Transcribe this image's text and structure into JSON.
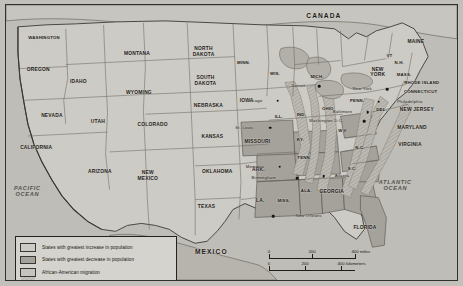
{
  "figure": {
    "kind": "thematic-map"
  },
  "countries": [
    {
      "name": "CANADA",
      "x": 330,
      "y": 16
    },
    {
      "name": "MEXICO",
      "x": 215,
      "y": 259
    }
  ],
  "oceans": [
    {
      "name": "PACIFIC",
      "name2": "OCEAN",
      "x": 27,
      "y": 196
    },
    {
      "name": "ATLANTIC",
      "name2": "OCEAN",
      "x": 403,
      "y": 190
    }
  ],
  "states": [
    {
      "label": "WASHINGTON",
      "x": 44,
      "y": 38,
      "size": "xs"
    },
    {
      "label": "OREGON",
      "x": 38,
      "y": 70,
      "size": "sm"
    },
    {
      "label": "IDAHO",
      "x": 79,
      "y": 83,
      "size": "sm"
    },
    {
      "label": "NEVADA",
      "x": 52,
      "y": 118,
      "size": "sm"
    },
    {
      "label": "CALIFORNIA",
      "x": 36,
      "y": 151,
      "size": "sm"
    },
    {
      "label": "MONTANA",
      "x": 139,
      "y": 54,
      "size": "sm"
    },
    {
      "label": "WYOMING",
      "x": 141,
      "y": 94,
      "size": "sm"
    },
    {
      "label": "UTAH",
      "x": 99,
      "y": 124,
      "size": "sm"
    },
    {
      "label": "COLORADO",
      "x": 155,
      "y": 127,
      "size": "sm"
    },
    {
      "label": "ARIZONA",
      "x": 101,
      "y": 176,
      "size": "sm"
    },
    {
      "label": "NORTH",
      "label2": "DAKOTA",
      "x": 207,
      "y": 52,
      "size": "sm"
    },
    {
      "label": "SOUTH",
      "label2": "DAKOTA",
      "x": 209,
      "y": 82,
      "size": "sm"
    },
    {
      "label": "NEBRASKA",
      "x": 212,
      "y": 107,
      "size": "sm"
    },
    {
      "label": "KANSAS",
      "x": 216,
      "y": 139,
      "size": "sm"
    },
    {
      "label": "MINN.",
      "x": 248,
      "y": 64,
      "size": "xs"
    },
    {
      "label": "IOWA",
      "x": 251,
      "y": 102,
      "size": "sm"
    },
    {
      "label": "WIS.",
      "x": 280,
      "y": 75,
      "size": "xs"
    },
    {
      "label": "MISSOURI",
      "x": 262,
      "y": 145,
      "size": "sm"
    },
    {
      "label": "ILL.",
      "x": 284,
      "y": 120,
      "size": "xs"
    },
    {
      "label": "IND.",
      "x": 307,
      "y": 118,
      "size": "xs"
    },
    {
      "label": "MICH.",
      "x": 323,
      "y": 78,
      "size": "xs"
    },
    {
      "label": "OHIO",
      "x": 334,
      "y": 112,
      "size": "xs"
    },
    {
      "label": "KY.",
      "x": 306,
      "y": 143,
      "size": "xs"
    },
    {
      "label": "TENN.",
      "x": 310,
      "y": 162,
      "size": "xs"
    },
    {
      "label": "NEW",
      "label2": "MEXICO",
      "x": 150,
      "y": 180,
      "size": "sm"
    },
    {
      "label": "OKLAHOMA",
      "x": 221,
      "y": 176,
      "size": "sm"
    },
    {
      "label": "ARK.",
      "x": 263,
      "y": 173,
      "size": "sm"
    },
    {
      "label": "TEXAS",
      "x": 210,
      "y": 212,
      "size": "sm"
    },
    {
      "label": "LA.",
      "x": 265,
      "y": 205,
      "size": "sm"
    },
    {
      "label": "MISS.",
      "x": 289,
      "y": 207,
      "size": "xs"
    },
    {
      "label": "ALA.",
      "x": 312,
      "y": 196,
      "size": "xs"
    },
    {
      "label": "GEORGIA",
      "x": 338,
      "y": 196,
      "size": "sm"
    },
    {
      "label": "S.C.",
      "x": 359,
      "y": 173,
      "size": "xs"
    },
    {
      "label": "N.C.",
      "x": 367,
      "y": 152,
      "size": "xs"
    },
    {
      "label": "FLORIDA",
      "x": 372,
      "y": 233,
      "size": "sm"
    },
    {
      "label": "W.V",
      "x": 349,
      "y": 134,
      "size": "xs"
    },
    {
      "label": "PENN.",
      "x": 364,
      "y": 103,
      "size": "xs"
    },
    {
      "label": "NEW",
      "label2": "YORK",
      "x": 385,
      "y": 73,
      "size": "sm"
    },
    {
      "label": "MAINE",
      "x": 424,
      "y": 41,
      "size": "sm"
    },
    {
      "label": "VT",
      "x": 397,
      "y": 57,
      "size": "xs"
    },
    {
      "label": "N.H.",
      "x": 407,
      "y": 64,
      "size": "xs"
    },
    {
      "label": "MASS.",
      "x": 412,
      "y": 76,
      "size": "xs"
    }
  ],
  "callouts": [
    {
      "label": "RHODE ISLAND",
      "x": 430,
      "y": 85,
      "size": "xs"
    },
    {
      "label": "CONNECTICUT",
      "x": 429,
      "y": 94,
      "size": "xs"
    },
    {
      "label": "NEW JERSEY",
      "x": 425,
      "y": 111,
      "size": "sm"
    },
    {
      "label": "MARYLAND",
      "x": 420,
      "y": 130,
      "size": "sm"
    },
    {
      "label": "VIRGINIA",
      "x": 418,
      "y": 148,
      "size": "sm"
    },
    {
      "label": "DEL.",
      "x": 389,
      "y": 113,
      "size": "xs"
    }
  ],
  "cities": [
    {
      "label": "Chicago",
      "x": 283,
      "y": 103,
      "dx": -16,
      "dy": 0
    },
    {
      "label": "Detroit",
      "x": 325,
      "y": 88,
      "dx": -14,
      "dy": 0
    },
    {
      "label": "St. Louis",
      "x": 275,
      "y": 131,
      "dx": -17,
      "dy": 0
    },
    {
      "label": "Memphis",
      "x": 285,
      "y": 171,
      "dx": -16,
      "dy": 0
    },
    {
      "label": "Birmingham",
      "x": 303,
      "y": 183,
      "dx": -22,
      "dy": 0
    },
    {
      "label": "Atlanta",
      "x": 330,
      "y": 181,
      "dx": 11,
      "dy": 0
    },
    {
      "label": "New Orleans",
      "x": 278,
      "y": 222,
      "dx": 23,
      "dy": 0
    },
    {
      "label": "New York",
      "x": 395,
      "y": 91,
      "dx": -16,
      "dy": 0
    },
    {
      "label": "Philadelphia",
      "x": 386,
      "y": 104,
      "dx": 19,
      "dy": 0
    },
    {
      "label": "Baltimore",
      "x": 375,
      "y": 115,
      "dx": -16,
      "dy": 0
    },
    {
      "label": "Washington D.C.",
      "x": 371,
      "y": 124,
      "dx": -21,
      "dy": 0
    }
  ],
  "legend": {
    "items": [
      {
        "swatch": "increase",
        "text": "States with greatest increase in population"
      },
      {
        "swatch": "decrease",
        "text": "States with greatest decrease in population"
      },
      {
        "swatch": "migration",
        "text": "African-American migration"
      }
    ]
  },
  "scale": {
    "miles": {
      "ticks": [
        "0",
        "200",
        "400"
      ],
      "unit": "miles"
    },
    "kilometers": {
      "ticks": [
        "0",
        "200",
        "400"
      ],
      "unit": "kilometers"
    }
  },
  "colors": {
    "land": "#cfcdc7",
    "water": "#bfbdb7",
    "increase": "#cdcbc5",
    "decrease": "#a5a29b",
    "migration_band": "#b4b1aa",
    "border": "#33312e",
    "frame": "#24221f"
  }
}
